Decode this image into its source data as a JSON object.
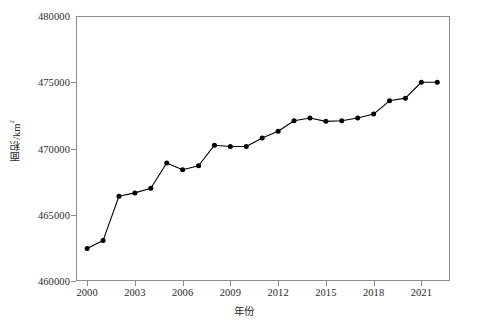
{
  "chart_data": {
    "type": "line",
    "title": "",
    "xlabel": "年份",
    "ylabel": "面积/km²",
    "ylabel_main": "面积/km",
    "ylabel_sup": "2",
    "x": [
      2000,
      2001,
      2002,
      2003,
      2004,
      2005,
      2006,
      2007,
      2008,
      2009,
      2010,
      2011,
      2012,
      2013,
      2014,
      2015,
      2016,
      2017,
      2018,
      2019,
      2020,
      2021,
      2022
    ],
    "values": [
      462450,
      463050,
      466400,
      466650,
      467000,
      468900,
      468400,
      468700,
      470250,
      470150,
      470150,
      470800,
      471300,
      472100,
      472300,
      472050,
      472100,
      472300,
      472600,
      473600,
      473800,
      475000,
      475000
    ],
    "series": [
      {
        "name": "面积",
        "values": [
          462450,
          463050,
          466400,
          466650,
          467000,
          468900,
          468400,
          468700,
          470250,
          470150,
          470150,
          470800,
          471300,
          472100,
          472300,
          472050,
          472100,
          472300,
          472600,
          473600,
          473800,
          475000,
          475000
        ]
      }
    ],
    "xlim": [
      1999.3,
      2022.8
    ],
    "ylim": [
      460000,
      480000
    ],
    "xticks": [
      2000,
      2003,
      2006,
      2009,
      2012,
      2015,
      2018,
      2021
    ],
    "xtick_labels": [
      "2000",
      "2003",
      "2006",
      "2009",
      "2012",
      "2015",
      "2018",
      "2021"
    ],
    "yticks": [
      460000,
      465000,
      470000,
      475000,
      480000
    ],
    "ytick_labels": [
      "460000",
      "465000",
      "470000",
      "475000",
      "480000"
    ],
    "grid": false,
    "legend": null,
    "marker": "circle-filled",
    "line_color": "#000000",
    "marker_color": "#000000",
    "axis_color": "#8b8b8b",
    "background_color": "#ffffff"
  }
}
